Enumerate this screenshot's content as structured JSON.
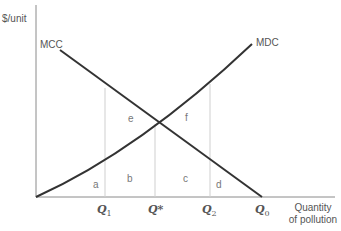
{
  "diagram": {
    "y_axis_label": "$/unit",
    "x_axis_label_line1": "Quantity",
    "x_axis_label_line2": "of pollution",
    "curves": {
      "mcc": {
        "label": "MCC",
        "shape": "straight line, downward sloping"
      },
      "mdc": {
        "label": "MDC",
        "shape": "convex curve, upward sloping from origin"
      }
    },
    "x_ticks": [
      {
        "base": "Q",
        "sub": "1"
      },
      {
        "base": "Q*",
        "sub": ""
      },
      {
        "base": "Q",
        "sub": "2"
      },
      {
        "base": "Q",
        "sub": "0"
      }
    ],
    "areas": {
      "a": "a",
      "b": "b",
      "c": "c",
      "d": "d",
      "e": "e",
      "f": "f"
    },
    "colors": {
      "curve": "#333333",
      "axis": "#888888",
      "guide": "#cccccc",
      "text": "#555555"
    }
  }
}
